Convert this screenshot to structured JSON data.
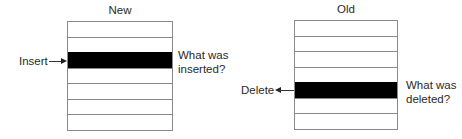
{
  "diagrams": {
    "new": {
      "title": "New",
      "rows": 7,
      "highlighted_row": 3,
      "pointer_label": "Insert",
      "question_line1": "What was",
      "question_line2": "inserted?"
    },
    "old": {
      "title": "Old",
      "rows": 7,
      "highlighted_row": 5,
      "pointer_label": "Delete",
      "question_line1": "What was",
      "question_line2": "deleted?"
    }
  },
  "colors": {
    "highlight": "#000000",
    "border": "#8a8a8a",
    "text": "#2a2a2a"
  }
}
